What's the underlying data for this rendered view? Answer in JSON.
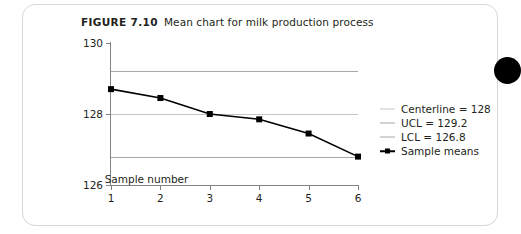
{
  "figure": {
    "number": "FIGURE 7.10",
    "caption": "Mean chart for milk production process"
  },
  "legend": {
    "items": [
      {
        "label": "Centerline = 128",
        "style": "line",
        "color": "#c3c5c7"
      },
      {
        "label": "UCL = 129.2",
        "style": "line",
        "color": "#a6a8ab"
      },
      {
        "label": "LCL = 126.8",
        "style": "line",
        "color": "#a6a8ab"
      },
      {
        "label": "Sample means",
        "style": "line-marker",
        "color": "#000000"
      }
    ]
  },
  "chart_data": {
    "type": "line",
    "title": "Mean chart for milk production process",
    "xlabel": "Sample number",
    "ylabel": "",
    "x": [
      1,
      2,
      3,
      4,
      5,
      6
    ],
    "categories": [
      "1",
      "2",
      "3",
      "4",
      "5",
      "6"
    ],
    "series": [
      {
        "name": "Sample means",
        "values": [
          128.7,
          128.45,
          128.0,
          127.85,
          127.45,
          126.8
        ],
        "color": "#000000",
        "marker": "square"
      }
    ],
    "reference_lines": [
      {
        "name": "UCL",
        "value": 129.2,
        "color": "#a6a8ab"
      },
      {
        "name": "Centerline",
        "value": 128.0,
        "color": "#c3c5c7"
      },
      {
        "name": "LCL",
        "value": 126.8,
        "color": "#a6a8ab"
      }
    ],
    "xlim": [
      1,
      6
    ],
    "ylim": [
      126,
      130
    ],
    "yticks": [
      126,
      128,
      130
    ],
    "ytick_labels": [
      "126",
      "128",
      "130"
    ],
    "xticks": [
      1,
      2,
      3,
      4,
      5,
      6
    ],
    "xtick_labels": [
      "1",
      "2",
      "3",
      "4",
      "5",
      "6"
    ],
    "grid": false,
    "legend_position": "right"
  }
}
